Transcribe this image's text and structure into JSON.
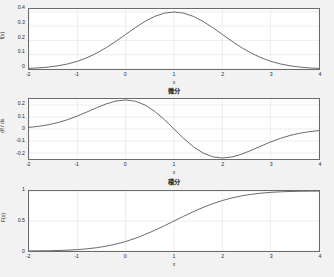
{
  "figure": {
    "background_color": "#f2f2f2",
    "axes_background_color": "#ffffff",
    "axes_border_color": "#6b6b6b",
    "grid_color": "#d9d9d9",
    "curve_color": "#555555"
  },
  "chart_data": [
    {
      "type": "line",
      "id": "pdf",
      "title": "",
      "xlabel": "x",
      "ylabel": "f(x)",
      "xlim": [
        -2,
        4
      ],
      "ylim": [
        0,
        0.42
      ],
      "xticks": [
        -2,
        -1,
        0,
        1,
        2,
        3,
        4
      ],
      "xtick_labels": [
        "-2",
        "-1",
        "0",
        "1",
        "2",
        "3",
        "4"
      ],
      "yticks": [
        0,
        0.1,
        0.2,
        0.3,
        0.4
      ],
      "ytick_labels": [
        "0",
        "0.1",
        "0.2",
        "0.3",
        "0.4"
      ],
      "grid": true,
      "legend": "none",
      "description": "Gaussian probability density, mean 1, sigma 1, peak 0.399 at x = 1",
      "x": [
        -2,
        -1.8,
        -1.6,
        -1.4,
        -1.2,
        -1,
        -0.8,
        -0.6,
        -0.4,
        -0.2,
        0,
        0.2,
        0.4,
        0.6,
        0.8,
        1,
        1.2,
        1.4,
        1.6,
        1.8,
        2,
        2.2,
        2.4,
        2.6,
        2.8,
        3,
        3.2,
        3.4,
        3.6,
        3.8,
        4
      ],
      "values": [
        0.0044,
        0.0079,
        0.0136,
        0.0224,
        0.0355,
        0.054,
        0.079,
        0.1109,
        0.1497,
        0.1942,
        0.242,
        0.2897,
        0.3332,
        0.3683,
        0.391,
        0.3989,
        0.391,
        0.3683,
        0.3332,
        0.2897,
        0.242,
        0.1942,
        0.1497,
        0.1109,
        0.079,
        0.054,
        0.0355,
        0.0224,
        0.0136,
        0.0079,
        0.0044
      ]
    },
    {
      "type": "line",
      "id": "derivative",
      "title": "微分",
      "xlabel": "x",
      "ylabel": "df / dx",
      "xlim": [
        -2,
        4
      ],
      "ylim": [
        -0.25,
        0.25
      ],
      "xticks": [
        -2,
        -1,
        0,
        1,
        2,
        3,
        4
      ],
      "xtick_labels": [
        "-2",
        "-1",
        "0",
        "1",
        "2",
        "3",
        "4"
      ],
      "yticks": [
        -0.2,
        -0.1,
        0,
        0.1,
        0.2
      ],
      "ytick_labels": [
        "-0.2",
        "-0.1",
        "0",
        "0.1",
        "0.2"
      ],
      "grid": true,
      "legend": "none",
      "description": "Derivative of the Gaussian; max +0.242 at x = 0, zero at x = 1, min -0.242 at x = 2",
      "x": [
        -2,
        -1.8,
        -1.6,
        -1.4,
        -1.2,
        -1,
        -0.8,
        -0.6,
        -0.4,
        -0.2,
        0,
        0.2,
        0.4,
        0.6,
        0.8,
        1,
        1.2,
        1.4,
        1.6,
        1.8,
        2,
        2.2,
        2.4,
        2.6,
        2.8,
        3,
        3.2,
        3.4,
        3.6,
        3.8,
        4
      ],
      "values": [
        0.0133,
        0.0222,
        0.0353,
        0.0538,
        0.0781,
        0.108,
        0.1422,
        0.1774,
        0.2096,
        0.233,
        0.242,
        0.2318,
        0.1999,
        0.1473,
        0.0782,
        0,
        -0.0782,
        -0.1473,
        -0.1999,
        -0.2318,
        -0.242,
        -0.233,
        -0.2096,
        -0.1774,
        -0.1422,
        -0.108,
        -0.0781,
        -0.0538,
        -0.0353,
        -0.0222,
        -0.0133
      ]
    },
    {
      "type": "line",
      "id": "integral",
      "title": "積分",
      "xlabel": "x",
      "ylabel": "F(x)",
      "xlim": [
        -2,
        4
      ],
      "ylim": [
        0,
        1
      ],
      "xticks": [
        -2,
        -1,
        0,
        1,
        2,
        3,
        4
      ],
      "xtick_labels": [
        "-2",
        "-1",
        "0",
        "1",
        "2",
        "3",
        "4"
      ],
      "yticks": [
        0,
        0.5,
        1
      ],
      "ytick_labels": [
        "0",
        "0.5",
        "1"
      ],
      "grid": true,
      "legend": "none",
      "description": "Cumulative distribution of the Gaussian; 0.5 at x = 1, saturating near 1 by x = 3",
      "x": [
        -2,
        -1.8,
        -1.6,
        -1.4,
        -1.2,
        -1,
        -0.8,
        -0.6,
        -0.4,
        -0.2,
        0,
        0.2,
        0.4,
        0.6,
        0.8,
        1,
        1.2,
        1.4,
        1.6,
        1.8,
        2,
        2.2,
        2.4,
        2.6,
        2.8,
        3,
        3.2,
        3.4,
        3.6,
        3.8,
        4
      ],
      "values": [
        0.0013,
        0.0026,
        0.0047,
        0.0082,
        0.0139,
        0.0228,
        0.0359,
        0.0548,
        0.0808,
        0.1151,
        0.1587,
        0.2119,
        0.2743,
        0.3446,
        0.4207,
        0.5,
        0.5793,
        0.6554,
        0.7257,
        0.7881,
        0.8413,
        0.8849,
        0.9192,
        0.9452,
        0.9641,
        0.9772,
        0.9861,
        0.9918,
        0.9953,
        0.9974,
        0.9987
      ]
    }
  ]
}
